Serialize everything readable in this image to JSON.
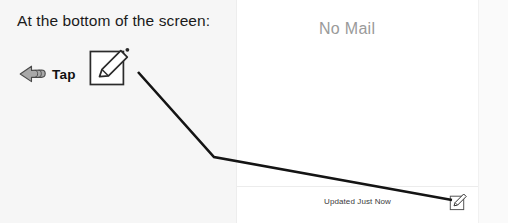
{
  "instruction": {
    "heading": "At the bottom of the screen:",
    "action_label": "Tap",
    "cursor_icon": "pointing-hand-icon",
    "target_icon": "compose-icon"
  },
  "device_screen": {
    "empty_state_text": "No Mail",
    "toolbar": {
      "status_text": "Updated Just Now",
      "compose_icon": "compose-icon"
    }
  },
  "annotation": {
    "leader_line_name": "callout-leader-line"
  },
  "colors": {
    "page_background": "#f6f6f6",
    "device_background": "#ffffff",
    "heading_text": "#1b1b1b",
    "empty_state_text": "#9a9a9a",
    "status_text": "#3a3a3a",
    "line_stroke": "#141414",
    "hand_fill": "#a8a8a8",
    "icon_stroke": "#2b2b2b"
  }
}
